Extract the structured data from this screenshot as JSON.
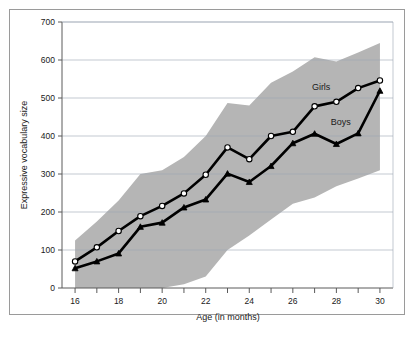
{
  "chart_data": {
    "type": "line",
    "title": "",
    "subtitle": "",
    "xlabel": "Age (in months)",
    "ylabel": "Expressive vocabulary size",
    "xlim": [
      15.4,
      30.6
    ],
    "ylim": [
      0,
      700
    ],
    "xticks": [
      16,
      17,
      18,
      19,
      20,
      21,
      22,
      23,
      24,
      25,
      26,
      27,
      28,
      29,
      30
    ],
    "xtick_labels": [
      "16",
      "",
      "18",
      "",
      "20",
      "",
      "22",
      "",
      "24",
      "",
      "26",
      "",
      "28",
      "",
      "30"
    ],
    "yticks": [
      0,
      100,
      200,
      300,
      400,
      500,
      600,
      700
    ],
    "ytick_labels": [
      "0",
      "100",
      "200",
      "300",
      "400",
      "500",
      "600",
      "700"
    ],
    "grid": "horizontal",
    "legend_position": "inline-annotations",
    "x": [
      16,
      17,
      18,
      19,
      20,
      21,
      22,
      23,
      24,
      25,
      26,
      27,
      28,
      29,
      30
    ],
    "series": [
      {
        "name": "Girls",
        "marker": "open-circle",
        "color": "#000000",
        "marker_fill": "#ffffff",
        "values": [
          70,
          107,
          150,
          189,
          216,
          249,
          298,
          370,
          339,
          400,
          411,
          478,
          490,
          526,
          546
        ]
      },
      {
        "name": "Boys",
        "marker": "filled-triangle",
        "color": "#000000",
        "marker_fill": "#000000",
        "values": [
          52,
          70,
          91,
          161,
          172,
          212,
          233,
          301,
          279,
          321,
          381,
          406,
          379,
          407,
          519
        ]
      }
    ],
    "band": {
      "name": "variability range",
      "color": "#b5b5b5",
      "upper": [
        125,
        175,
        230,
        300,
        310,
        345,
        400,
        487,
        480,
        540,
        570,
        607,
        596,
        620,
        645
      ],
      "lower": [
        0,
        0,
        0,
        0,
        0,
        10,
        30,
        100,
        138,
        180,
        222,
        238,
        268,
        288,
        310
      ]
    },
    "annotations": [
      {
        "text": "Girls",
        "x": 27.3,
        "y": 520
      },
      {
        "text": "Boys",
        "x": 28.2,
        "y": 430
      }
    ]
  }
}
